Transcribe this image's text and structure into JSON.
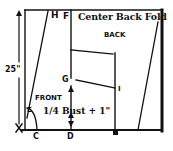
{
  "diagram": {
    "title": "Center Back Fold",
    "pieces": {
      "back": "BACK",
      "front": "FRONT"
    },
    "measurements": {
      "length": "25\"",
      "width": "1/4 Bust + 1\""
    },
    "points": {
      "A": "A",
      "B": "B",
      "C": "C",
      "D": "D",
      "E": "E",
      "F": "F",
      "G": "G",
      "H": "H",
      "I": "I"
    },
    "colors": {
      "ink": "#111111",
      "paper": "#ffffff"
    }
  }
}
